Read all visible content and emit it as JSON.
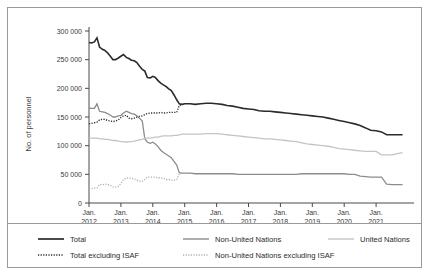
{
  "chart_data": {
    "type": "line",
    "title": "",
    "xlabel": "",
    "ylabel": "No. of personnel",
    "ylim": [
      0,
      300000
    ],
    "yticks": [
      0,
      50000,
      100000,
      150000,
      200000,
      250000,
      300000
    ],
    "ytick_labels": [
      "0",
      "50 000",
      "100 000",
      "150 000",
      "200 000",
      "250 000",
      "300 000"
    ],
    "xlim": [
      2012.0,
      2022.0
    ],
    "xticks": [
      2012,
      2013,
      2014,
      2015,
      2016,
      2017,
      2018,
      2019,
      2020,
      2021
    ],
    "xtick_labels": [
      [
        "Jan.",
        "2012"
      ],
      [
        "Jan.",
        "2013"
      ],
      [
        "Jan.",
        "2014"
      ],
      [
        "Jan.",
        "2015"
      ],
      [
        "Jan.",
        "2016"
      ],
      [
        "Jan.",
        "2017"
      ],
      [
        "Jan.",
        "2018"
      ],
      [
        "Jan.",
        "2019"
      ],
      [
        "Jan.",
        "2020"
      ],
      [
        "Jan.",
        "2021"
      ]
    ],
    "grid": false,
    "legend_position": "bottom",
    "series": [
      {
        "name": "Total",
        "style": "solid",
        "color": "#2b2b2b",
        "width": 1.6,
        "x": [
          2012.0,
          2012.08,
          2012.17,
          2012.25,
          2012.33,
          2012.42,
          2012.5,
          2012.58,
          2012.67,
          2012.75,
          2012.83,
          2012.92,
          2013.0,
          2013.08,
          2013.17,
          2013.25,
          2013.33,
          2013.42,
          2013.5,
          2013.58,
          2013.67,
          2013.75,
          2013.83,
          2013.92,
          2014.0,
          2014.08,
          2014.17,
          2014.25,
          2014.33,
          2014.42,
          2014.5,
          2014.58,
          2014.67,
          2014.75,
          2014.83,
          2014.92,
          2015.0,
          2015.17,
          2015.33,
          2015.5,
          2015.67,
          2015.83,
          2016.0,
          2016.17,
          2016.33,
          2016.5,
          2016.67,
          2016.83,
          2017.0,
          2017.17,
          2017.33,
          2017.5,
          2017.67,
          2017.83,
          2018.0,
          2018.17,
          2018.33,
          2018.5,
          2018.67,
          2018.83,
          2019.0,
          2019.17,
          2019.33,
          2019.5,
          2019.67,
          2019.83,
          2020.0,
          2020.17,
          2020.33,
          2020.5,
          2020.67,
          2020.83,
          2021.0,
          2021.17,
          2021.33,
          2021.5,
          2021.67,
          2021.83
        ],
        "y": [
          280000,
          279000,
          281000,
          288000,
          272000,
          268000,
          266000,
          262000,
          256000,
          250000,
          250000,
          253000,
          256000,
          259000,
          254000,
          252000,
          249000,
          248000,
          245000,
          239000,
          233000,
          230000,
          219000,
          218000,
          221000,
          219000,
          213000,
          209000,
          206000,
          203000,
          199000,
          196000,
          188000,
          180000,
          173000,
          172000,
          173000,
          173000,
          172000,
          173000,
          174000,
          174000,
          173000,
          172000,
          170000,
          169000,
          167000,
          165000,
          164000,
          163000,
          161000,
          160000,
          160000,
          159000,
          158000,
          157000,
          156000,
          155000,
          154000,
          153000,
          152000,
          151000,
          150000,
          148000,
          146000,
          144000,
          142000,
          140000,
          138000,
          135000,
          131000,
          127000,
          126000,
          124000,
          119000,
          119000,
          119000,
          119000
        ]
      },
      {
        "name": "Total excluding ISAF",
        "style": "dotted",
        "color": "#2b2b2b",
        "width": 1.4,
        "x": [
          2012.0,
          2012.08,
          2012.17,
          2012.25,
          2012.33,
          2012.42,
          2012.5,
          2012.58,
          2012.67,
          2012.75,
          2012.83,
          2012.92,
          2013.0,
          2013.08,
          2013.17,
          2013.25,
          2013.33,
          2013.42,
          2013.5,
          2013.58,
          2013.67,
          2013.75,
          2013.83,
          2013.92,
          2014.0,
          2014.08,
          2014.17,
          2014.25,
          2014.33,
          2014.42,
          2014.5,
          2014.58,
          2014.67,
          2014.75,
          2014.83,
          2014.92
        ],
        "y": [
          138000,
          139000,
          140000,
          141000,
          145000,
          146000,
          146000,
          144000,
          143000,
          142000,
          143000,
          145000,
          149000,
          152000,
          153000,
          148000,
          147000,
          148000,
          150000,
          151000,
          152000,
          154000,
          156000,
          157000,
          157000,
          157000,
          157000,
          158000,
          157000,
          157000,
          158000,
          158000,
          158000,
          158000,
          170000,
          172000
        ]
      },
      {
        "name": "Non-United Nations",
        "style": "solid",
        "color": "#8c8c8c",
        "width": 1.3,
        "x": [
          2012.0,
          2012.08,
          2012.17,
          2012.25,
          2012.33,
          2012.42,
          2012.5,
          2012.58,
          2012.67,
          2012.75,
          2012.83,
          2012.92,
          2013.0,
          2013.08,
          2013.17,
          2013.25,
          2013.33,
          2013.42,
          2013.5,
          2013.58,
          2013.67,
          2013.75,
          2013.83,
          2013.92,
          2014.0,
          2014.08,
          2014.17,
          2014.25,
          2014.33,
          2014.42,
          2014.5,
          2014.58,
          2014.67,
          2014.75,
          2014.83,
          2014.92,
          2015.0,
          2015.17,
          2015.33,
          2015.5,
          2015.67,
          2015.83,
          2016.0,
          2016.17,
          2016.33,
          2016.5,
          2016.67,
          2016.83,
          2017.0,
          2017.17,
          2017.33,
          2017.5,
          2017.67,
          2017.83,
          2018.0,
          2018.17,
          2018.33,
          2018.5,
          2018.67,
          2018.83,
          2019.0,
          2019.17,
          2019.33,
          2019.5,
          2019.67,
          2019.83,
          2020.0,
          2020.17,
          2020.33,
          2020.5,
          2020.67,
          2020.83,
          2021.0,
          2021.17,
          2021.33,
          2021.5,
          2021.67,
          2021.83
        ],
        "y": [
          166000,
          165000,
          165000,
          173000,
          160000,
          159000,
          158000,
          156000,
          153000,
          150000,
          150000,
          152000,
          153000,
          157000,
          160000,
          158000,
          156000,
          155000,
          152000,
          148000,
          143000,
          112000,
          106000,
          104000,
          106000,
          103000,
          98000,
          92000,
          88000,
          85000,
          82000,
          79000,
          72000,
          66000,
          53000,
          52000,
          52000,
          52000,
          51000,
          51000,
          51000,
          51000,
          51000,
          51000,
          51000,
          51000,
          50000,
          50000,
          50000,
          50000,
          50000,
          50000,
          50000,
          50000,
          50000,
          50000,
          50000,
          50000,
          51000,
          51000,
          51000,
          51000,
          51000,
          51000,
          51000,
          51000,
          51000,
          50000,
          50000,
          47000,
          46000,
          45000,
          45000,
          45000,
          33000,
          32000,
          32000,
          32000
        ]
      },
      {
        "name": "Non-United Nations excluding ISAF",
        "style": "dotted",
        "color": "#b0b0b0",
        "width": 1.3,
        "x": [
          2012.0,
          2012.08,
          2012.17,
          2012.25,
          2012.33,
          2012.42,
          2012.5,
          2012.58,
          2012.67,
          2012.75,
          2012.83,
          2012.92,
          2013.0,
          2013.08,
          2013.17,
          2013.25,
          2013.33,
          2013.42,
          2013.5,
          2013.58,
          2013.67,
          2013.75,
          2013.83,
          2013.92,
          2014.0,
          2014.08,
          2014.17,
          2014.25,
          2014.33,
          2014.42,
          2014.5,
          2014.58,
          2014.67,
          2014.75,
          2014.83,
          2014.92
        ],
        "y": [
          25000,
          25000,
          26000,
          26000,
          32000,
          32000,
          33000,
          32000,
          31000,
          28000,
          28000,
          29000,
          34000,
          41000,
          43000,
          44000,
          43000,
          42000,
          40000,
          38000,
          38000,
          41000,
          45000,
          45000,
          45000,
          45000,
          44000,
          44000,
          43000,
          41000,
          41000,
          40000,
          40000,
          41000,
          51000,
          52000
        ]
      },
      {
        "name": "United Nations",
        "style": "solid",
        "color": "#c4c4c4",
        "width": 1.3,
        "x": [
          2012.0,
          2012.08,
          2012.17,
          2012.25,
          2012.33,
          2012.42,
          2012.5,
          2012.58,
          2012.67,
          2012.75,
          2012.83,
          2012.92,
          2013.0,
          2013.08,
          2013.17,
          2013.25,
          2013.33,
          2013.42,
          2013.5,
          2013.58,
          2013.67,
          2013.75,
          2013.83,
          2013.92,
          2014.0,
          2014.08,
          2014.17,
          2014.25,
          2014.33,
          2014.42,
          2014.5,
          2014.58,
          2014.67,
          2014.75,
          2014.83,
          2014.92,
          2015.0,
          2015.17,
          2015.33,
          2015.5,
          2015.67,
          2015.83,
          2016.0,
          2016.17,
          2016.33,
          2016.5,
          2016.67,
          2016.83,
          2017.0,
          2017.17,
          2017.33,
          2017.5,
          2017.67,
          2017.83,
          2018.0,
          2018.17,
          2018.33,
          2018.5,
          2018.67,
          2018.83,
          2019.0,
          2019.17,
          2019.33,
          2019.5,
          2019.67,
          2019.83,
          2020.0,
          2020.17,
          2020.33,
          2020.5,
          2020.67,
          2020.83,
          2021.0,
          2021.17,
          2021.33,
          2021.5,
          2021.67,
          2021.83
        ],
        "y": [
          113000,
          113000,
          113000,
          113000,
          112000,
          112000,
          111000,
          111000,
          110000,
          109000,
          109000,
          108000,
          107000,
          107000,
          106000,
          107000,
          107000,
          108000,
          109000,
          110000,
          111000,
          113000,
          113000,
          113000,
          114000,
          115000,
          115000,
          116000,
          117000,
          117000,
          117000,
          117000,
          118000,
          118000,
          119000,
          120000,
          120000,
          120000,
          120000,
          120000,
          121000,
          121000,
          121000,
          120000,
          119000,
          118000,
          117000,
          116000,
          115000,
          114000,
          113000,
          112000,
          112000,
          111000,
          110000,
          109000,
          108000,
          107000,
          105000,
          103000,
          102000,
          101000,
          100000,
          99000,
          97000,
          95000,
          94000,
          93000,
          92000,
          91000,
          90000,
          90000,
          90000,
          84000,
          84000,
          84000,
          86000,
          88000
        ]
      }
    ]
  },
  "legend": {
    "items": [
      {
        "label": "Total",
        "style": "solid",
        "color": "#2b2b2b",
        "width": 1.7
      },
      {
        "label": "Non-United Nations",
        "style": "solid",
        "color": "#8c8c8c",
        "width": 1.4
      },
      {
        "label": "United Nations",
        "style": "solid",
        "color": "#c4c4c4",
        "width": 1.4
      },
      {
        "label": "Total excluding ISAF",
        "style": "dotted",
        "color": "#2b2b2b",
        "width": 1.4
      },
      {
        "label": "Non-United Nations excluding ISAF",
        "style": "dotted",
        "color": "#b0b0b0",
        "width": 1.4
      }
    ]
  },
  "colors": {
    "total": "#2b2b2b",
    "non_un": "#8c8c8c",
    "un": "#c4c4c4",
    "non_un_excl_isaf": "#b0b0b0",
    "axis": "#4a4a4a",
    "border": "#9a9a9a"
  }
}
